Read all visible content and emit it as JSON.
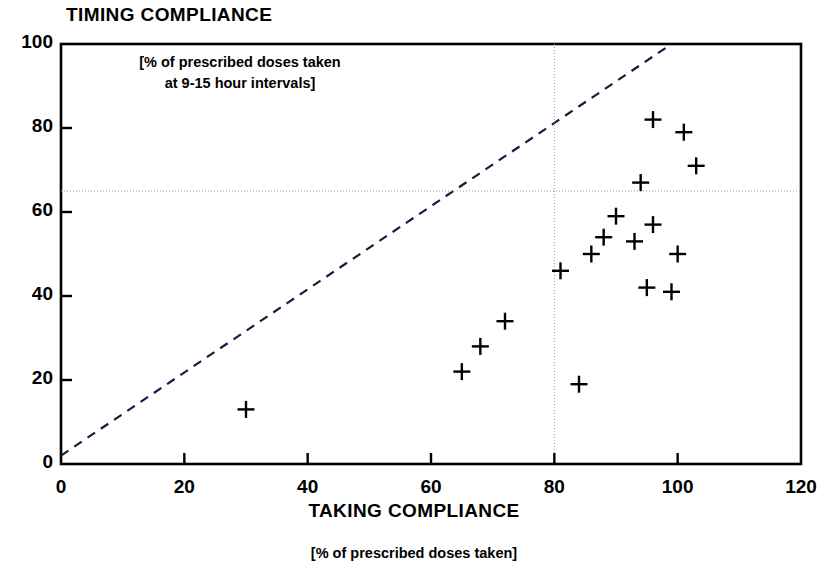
{
  "chart_data": {
    "type": "scatter",
    "title": "TIMING COMPLIANCE",
    "ylabel": "TIMING COMPLIANCE",
    "ylabel_note": "[% of prescribed doses taken\nat 9-15 hour intervals]",
    "xlabel": "TAKING COMPLIANCE",
    "xlabel_note": "[% of prescribed doses taken]",
    "xlim": [
      0,
      120
    ],
    "ylim": [
      0,
      100
    ],
    "xticks": [
      0,
      20,
      40,
      60,
      80,
      100,
      120
    ],
    "yticks": [
      0,
      20,
      40,
      60,
      80,
      100
    ],
    "grid": false,
    "marker": "plus",
    "marker_color": "#000000",
    "axis_color": "#000000",
    "reference_lines": [
      {
        "name": "identity-diagonal",
        "type": "diagonal",
        "style": "dashed",
        "from": [
          0,
          2
        ],
        "to": [
          99,
          100
        ],
        "color": "#1a1a40"
      },
      {
        "name": "timing-threshold",
        "type": "horizontal",
        "style": "dotted",
        "value": 65,
        "color": "#9a9a9a"
      },
      {
        "name": "taking-threshold",
        "type": "vertical",
        "style": "dotted",
        "value": 80,
        "color": "#9a9a9a"
      }
    ],
    "points": [
      {
        "x": 30,
        "y": 13
      },
      {
        "x": 65,
        "y": 22
      },
      {
        "x": 68,
        "y": 28
      },
      {
        "x": 72,
        "y": 34
      },
      {
        "x": 81,
        "y": 46
      },
      {
        "x": 84,
        "y": 19
      },
      {
        "x": 86,
        "y": 50
      },
      {
        "x": 88,
        "y": 54
      },
      {
        "x": 90,
        "y": 59
      },
      {
        "x": 93,
        "y": 53
      },
      {
        "x": 94,
        "y": 67
      },
      {
        "x": 95,
        "y": 42
      },
      {
        "x": 96,
        "y": 82
      },
      {
        "x": 96,
        "y": 57
      },
      {
        "x": 99,
        "y": 41
      },
      {
        "x": 100,
        "y": 50
      },
      {
        "x": 101,
        "y": 79
      },
      {
        "x": 103,
        "y": 71
      }
    ]
  }
}
